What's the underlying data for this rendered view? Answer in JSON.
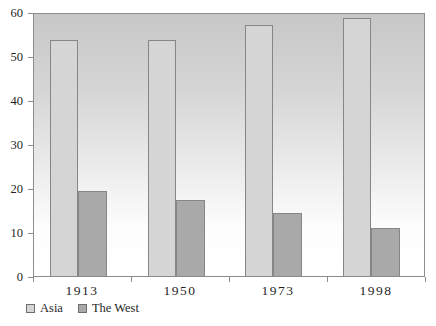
{
  "chart_data": {
    "type": "bar",
    "title": "",
    "xlabel": "",
    "ylabel": "",
    "categories": [
      "1913",
      "1950",
      "1973",
      "1998"
    ],
    "series": [
      {
        "name": "Asia",
        "values": [
          54,
          54,
          57.5,
          59
        ],
        "color": "#d5d5d5"
      },
      {
        "name": "The West",
        "values": [
          19.5,
          17.5,
          14.5,
          11
        ],
        "color": "#a9a9a9"
      }
    ],
    "ylim": [
      0,
      60
    ],
    "yticks": [
      0,
      10,
      20,
      30,
      40,
      50,
      60
    ],
    "grid": false,
    "legend_position": "bottom-left",
    "colors": {
      "axis_line": "#8c8c8c",
      "bar_border": "#868686",
      "text": "#1f1f1f",
      "plot_gradient_top": "#c7c7c7",
      "plot_gradient_bottom": "#ffffff"
    }
  }
}
